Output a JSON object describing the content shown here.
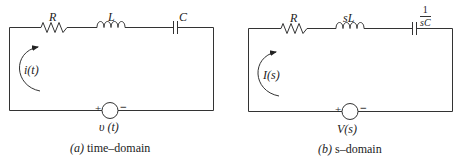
{
  "figure": {
    "panels": [
      {
        "id": "a",
        "caption_letter": "(a)",
        "caption_text": " time–domain",
        "components": {
          "resistor": "R",
          "inductor": "L",
          "capacitor": "C"
        },
        "current_label": "i(t)",
        "source_label": "υ (t)",
        "source_plus": "+",
        "source_minus": "−"
      },
      {
        "id": "b",
        "caption_letter": "(b)",
        "caption_text": " s–domain",
        "components": {
          "resistor": "R",
          "inductor": "sL",
          "capacitor_num": "1",
          "capacitor_den": "sC"
        },
        "current_label": "I(s)",
        "source_label": "V(s)",
        "source_plus": "+",
        "source_minus": "−"
      }
    ],
    "colors": {
      "wire": "#333333",
      "text": "#222222",
      "background": "#ffffff"
    }
  }
}
